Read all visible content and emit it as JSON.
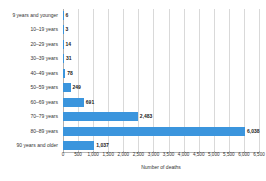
{
  "chart_data": {
    "type": "bar",
    "orientation": "horizontal",
    "title": "",
    "xlabel": "Number of deaths",
    "ylabel": "",
    "categories": [
      "9 years and younger",
      "10–19 years",
      "20–29 years",
      "30–39 years",
      "40–49 years",
      "50–59 years",
      "60–69 years",
      "70–79 years",
      "80–89 years",
      "90 years and older"
    ],
    "values": [
      6,
      3,
      14,
      31,
      78,
      249,
      691,
      2483,
      6038,
      1037
    ],
    "value_labels": [
      "6",
      "3",
      "14",
      "31",
      "78",
      "249",
      "691",
      "2,483",
      "6,038",
      "1,037"
    ],
    "xlim": [
      0,
      6500
    ],
    "xticks": [
      0,
      500,
      1000,
      1500,
      2000,
      2500,
      3000,
      3500,
      4000,
      4500,
      5000,
      5500,
      6000,
      6500
    ],
    "xtick_labels": [
      "0",
      "500",
      "1,000",
      "1,500",
      "2,000",
      "2,500",
      "3,000",
      "3,500",
      "4,000",
      "4,500",
      "5,000",
      "5,500",
      "6,000",
      "6,500"
    ],
    "grid": true,
    "legend": false,
    "bar_color": "#3b95dd",
    "gridline_color": "#d9d9d9",
    "text_color": "#333333"
  }
}
